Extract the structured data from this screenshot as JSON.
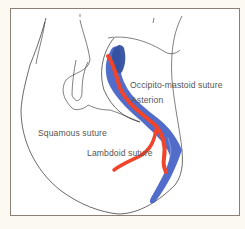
{
  "figure": {
    "type": "anatomical-diagram",
    "labels": {
      "occipito_mastoid": "Occipito-mastoid suture",
      "asterion": "Asterion",
      "squamous": "Squamous suture",
      "lambdoid": "Lambdoid suture"
    },
    "colors": {
      "artery_red": "#f0452a",
      "sinus_blue": "#3f5cc4",
      "outline": "#2a2a2a",
      "frame_border": "#8a8078",
      "background": "#fbf9f1"
    }
  }
}
